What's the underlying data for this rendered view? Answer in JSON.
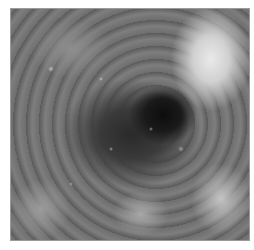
{
  "image": {
    "description": "Grayscale endoscopic view of a lumen with nodular mucosa; dark central lumen, bright mass at upper right",
    "colors": {
      "background": "#ffffff",
      "border": "#9a9a9a",
      "lumen": "#0d0d0d",
      "bright_mass": "#eaeaea",
      "mucosa": "#707070"
    }
  }
}
